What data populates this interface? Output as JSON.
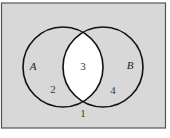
{
  "diagram": {
    "type": "venn",
    "colors": {
      "universe_fill": "#d8d8d8",
      "intersection_fill": "#ffffff",
      "stroke": "#111111",
      "frame": "#555555"
    },
    "sets": [
      {
        "name": "A"
      },
      {
        "name": "B"
      }
    ],
    "regions": [
      {
        "label": "1",
        "description": "outside A and B"
      },
      {
        "label": "2",
        "description": "A only"
      },
      {
        "label": "3",
        "description": "A and B (shaded white)"
      },
      {
        "label": "4",
        "description": "B only"
      }
    ]
  }
}
